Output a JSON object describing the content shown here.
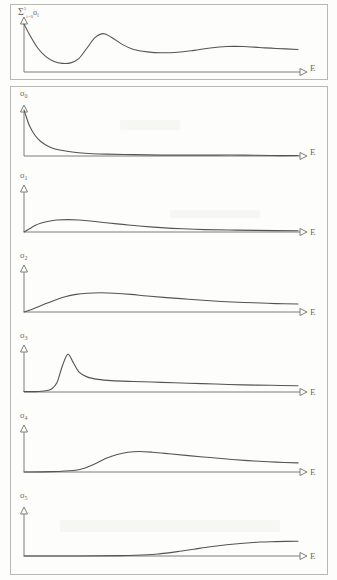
{
  "figure": {
    "y_axis_symbol": "↑",
    "x_axis_label": "E",
    "total_label": {
      "sigma": "Σ",
      "lower_limit": "i=0",
      "upper_limit": "5",
      "term": "σ",
      "term_sub": "i"
    }
  },
  "panels": [
    {
      "id": "total",
      "label_sigma": "σ",
      "label_sub": "i",
      "xlabel": "E"
    },
    {
      "id": "sigma0",
      "label_sigma": "σ",
      "label_sub": "0",
      "xlabel": "E"
    },
    {
      "id": "sigma1",
      "label_sigma": "σ",
      "label_sub": "1",
      "xlabel": "E"
    },
    {
      "id": "sigma2",
      "label_sigma": "σ",
      "label_sub": "2",
      "xlabel": "E"
    },
    {
      "id": "sigma3",
      "label_sigma": "σ",
      "label_sub": "3",
      "xlabel": "E"
    },
    {
      "id": "sigma4",
      "label_sigma": "σ",
      "label_sub": "4",
      "xlabel": "E"
    },
    {
      "id": "sigma5",
      "label_sigma": "σ",
      "label_sub": "5",
      "xlabel": "E"
    }
  ],
  "chart_data": {
    "type": "line",
    "xlabel": "E",
    "ylabel": "σ",
    "grid": false,
    "legend": "none",
    "xlim": [
      0,
      1
    ],
    "ylim": [
      0,
      1
    ],
    "note": "Schematic hand-drawn curves; x is energy E in arbitrary units, y is cross section sigma in arbitrary units. Values are normalized 0-1 read off the panel boxes.",
    "series": [
      {
        "name": "Σ(i=0..5) σi",
        "panel": "total",
        "description": "Total cross section: steep fall from high value at threshold, deep minimum, sharp resonance peak, shallow dip, then broad secondary bump decaying slowly.",
        "x": [
          0.0,
          0.02,
          0.05,
          0.08,
          0.11,
          0.14,
          0.17,
          0.2,
          0.23,
          0.26,
          0.29,
          0.32,
          0.36,
          0.4,
          0.45,
          0.5,
          0.56,
          0.62,
          0.68,
          0.74,
          0.8,
          0.86,
          0.92,
          1.0
        ],
        "y": [
          1.0,
          0.78,
          0.5,
          0.32,
          0.22,
          0.18,
          0.19,
          0.28,
          0.5,
          0.72,
          0.8,
          0.72,
          0.57,
          0.47,
          0.42,
          0.4,
          0.41,
          0.45,
          0.5,
          0.53,
          0.53,
          0.51,
          0.49,
          0.47
        ]
      },
      {
        "name": "σ0",
        "panel": "sigma0",
        "description": "Monotonic sharp decay from maximum at zero energy to near zero; long flat tail.",
        "x": [
          0.0,
          0.01,
          0.02,
          0.04,
          0.06,
          0.08,
          0.1,
          0.13,
          0.16,
          0.2,
          0.25,
          0.3,
          0.4,
          0.5,
          0.6,
          0.7,
          0.8,
          0.9,
          1.0
        ],
        "y": [
          1.0,
          0.82,
          0.66,
          0.45,
          0.32,
          0.24,
          0.18,
          0.13,
          0.1,
          0.07,
          0.05,
          0.04,
          0.03,
          0.02,
          0.02,
          0.02,
          0.02,
          0.01,
          0.01
        ]
      },
      {
        "name": "σ1",
        "panel": "sigma1",
        "description": "Rises quickly from zero to a low broad maximum near x=0.16, then slowly decays to a long flat tail.",
        "x": [
          0.0,
          0.02,
          0.04,
          0.06,
          0.09,
          0.12,
          0.16,
          0.2,
          0.25,
          0.3,
          0.36,
          0.42,
          0.5,
          0.58,
          0.66,
          0.75,
          0.85,
          1.0
        ],
        "y": [
          0.0,
          0.08,
          0.16,
          0.22,
          0.27,
          0.3,
          0.31,
          0.3,
          0.27,
          0.23,
          0.19,
          0.15,
          0.11,
          0.08,
          0.06,
          0.05,
          0.04,
          0.03
        ]
      },
      {
        "name": "σ2",
        "panel": "sigma2",
        "description": "Rises smoothly to a broad maximum near x=0.28, then declines gently with an almost linear tail that stays well above zero.",
        "x": [
          0.0,
          0.03,
          0.07,
          0.11,
          0.15,
          0.19,
          0.23,
          0.28,
          0.33,
          0.39,
          0.45,
          0.52,
          0.6,
          0.68,
          0.76,
          0.84,
          0.92,
          1.0
        ],
        "y": [
          0.0,
          0.07,
          0.18,
          0.29,
          0.38,
          0.44,
          0.47,
          0.48,
          0.47,
          0.44,
          0.4,
          0.36,
          0.32,
          0.28,
          0.25,
          0.23,
          0.21,
          0.2
        ]
      },
      {
        "name": "σ3",
        "panel": "sigma3",
        "description": "Flat near zero then a very sharp narrow resonance peak at x=0.16, rapid fall and a long slowly declining tail.",
        "x": [
          0.0,
          0.04,
          0.08,
          0.1,
          0.12,
          0.14,
          0.16,
          0.18,
          0.2,
          0.23,
          0.27,
          0.32,
          0.4,
          0.5,
          0.6,
          0.7,
          0.8,
          0.9,
          1.0
        ],
        "y": [
          0.01,
          0.01,
          0.03,
          0.07,
          0.22,
          0.62,
          0.9,
          0.7,
          0.48,
          0.36,
          0.3,
          0.27,
          0.25,
          0.23,
          0.21,
          0.19,
          0.17,
          0.16,
          0.15
        ]
      },
      {
        "name": "σ4",
        "panel": "sigma4",
        "description": "Zero until x≈0.20, then a delayed smooth rise to a broad hump near x=0.42, followed by a slow gentle decline.",
        "x": [
          0.0,
          0.1,
          0.18,
          0.22,
          0.26,
          0.3,
          0.34,
          0.38,
          0.42,
          0.47,
          0.53,
          0.6,
          0.68,
          0.76,
          0.84,
          0.92,
          1.0
        ],
        "y": [
          0.0,
          0.01,
          0.04,
          0.1,
          0.22,
          0.36,
          0.46,
          0.52,
          0.54,
          0.52,
          0.48,
          0.43,
          0.38,
          0.33,
          0.29,
          0.26,
          0.24
        ]
      },
      {
        "name": "σ5",
        "panel": "sigma5",
        "description": "Zero up to x≈0.45, then a late slow sigmoidal rise that is still increasing and flattening at the right edge.",
        "x": [
          0.0,
          0.2,
          0.35,
          0.45,
          0.5,
          0.56,
          0.62,
          0.68,
          0.74,
          0.8,
          0.86,
          0.92,
          1.0
        ],
        "y": [
          0.0,
          0.0,
          0.01,
          0.03,
          0.06,
          0.11,
          0.17,
          0.23,
          0.28,
          0.32,
          0.35,
          0.36,
          0.37
        ]
      }
    ]
  }
}
